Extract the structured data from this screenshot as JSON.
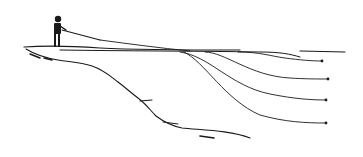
{
  "illustration": {
    "subject": "angler casting from a cliff with lines at different depths",
    "colors": {
      "ink": "#1a1a1a",
      "background": "#ffffff"
    },
    "lines": [
      {
        "name": "shallow",
        "end": [
          322,
          61
        ]
      },
      {
        "name": "mid-shallow",
        "end": [
          328,
          79
        ]
      },
      {
        "name": "mid-deep",
        "end": [
          326,
          100
        ]
      },
      {
        "name": "deep",
        "end": [
          326,
          123
        ]
      }
    ]
  }
}
